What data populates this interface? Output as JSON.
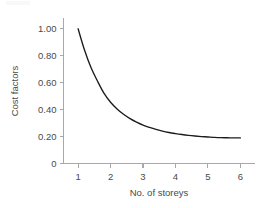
{
  "chart_data": {
    "type": "line",
    "title": "",
    "xlabel": "No. of storeys",
    "ylabel": "Cost factors",
    "xlim": [
      0.55,
      6.45
    ],
    "ylim": [
      0,
      1.08
    ],
    "grid": false,
    "legend": null,
    "x_ticks": [
      1,
      2,
      3,
      4,
      5,
      6
    ],
    "x_tick_labels": [
      "1",
      "2",
      "3",
      "4",
      "5",
      "6"
    ],
    "y_ticks": [
      0,
      0.2,
      0.4,
      0.6,
      0.8,
      1.0
    ],
    "y_tick_labels": [
      "0",
      "0.20",
      "0.40",
      "0.60",
      "0.80",
      "1.00"
    ],
    "series": [
      {
        "name": "Cost factor",
        "color": "#1c1c1c",
        "x": [
          1.0,
          1.2,
          1.4,
          1.6,
          1.8,
          2.0,
          2.2,
          2.4,
          2.6,
          2.8,
          3.0,
          3.2,
          3.4,
          3.6,
          3.8,
          4.0,
          4.2,
          4.4,
          4.6,
          4.8,
          5.0,
          5.2,
          5.4,
          5.6,
          5.8,
          6.0
        ],
        "values": [
          1.0,
          0.84,
          0.71,
          0.61,
          0.52,
          0.455,
          0.405,
          0.365,
          0.333,
          0.307,
          0.285,
          0.268,
          0.253,
          0.24,
          0.23,
          0.222,
          0.215,
          0.209,
          0.204,
          0.2,
          0.197,
          0.194,
          0.192,
          0.191,
          0.19,
          0.19
        ]
      }
    ]
  },
  "axis_style": {
    "axis_color": "#a8a8a8",
    "text_color": "#4a4a4a",
    "curve_color": "#1c1c1c",
    "background": "#ffffff"
  }
}
